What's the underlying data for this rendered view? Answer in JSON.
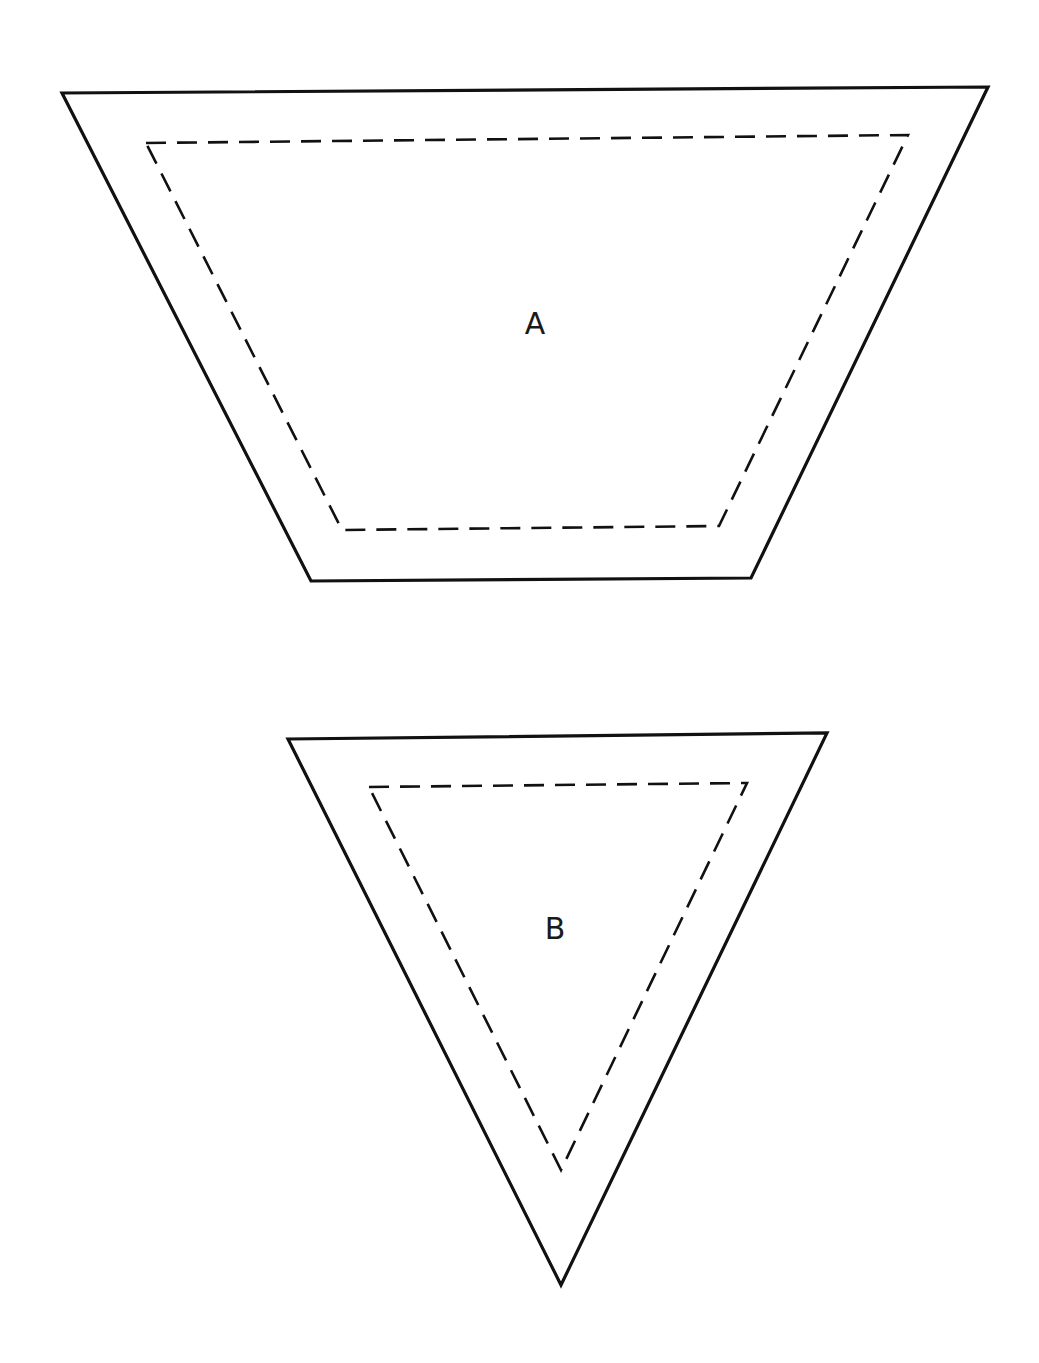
{
  "diagram": {
    "background": "#ffffff",
    "stroke_color": "#111111",
    "shapes": [
      {
        "id": "A",
        "label": "A",
        "type": "trapezoid",
        "outer_points": "62,93 988,87 751,578 311,581",
        "inner_points": "146,143 908,135 719,526 342,530",
        "label_position": {
          "x": 535,
          "y": 325
        }
      },
      {
        "id": "B",
        "label": "B",
        "type": "inverted-triangle",
        "outer_points": "288,739 827,733 561,1285",
        "inner_points": "369,787 747,783 561,1170",
        "label_position": {
          "x": 555,
          "y": 930
        }
      }
    ]
  }
}
